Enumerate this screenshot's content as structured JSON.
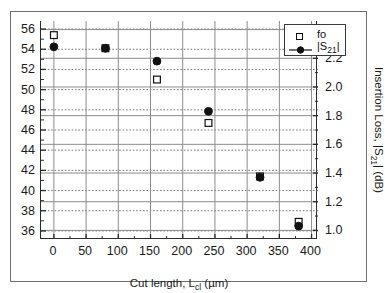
{
  "chart_data": {
    "type": "scatter",
    "title": "",
    "xlabel": "Cut length, L_cl (um)",
    "xlabel_parts": {
      "main": "Cut length, L",
      "sub": "cl",
      "tail": " (µm)"
    },
    "ylabel": "Center frequency, f_o (GHz)",
    "ylabel_parts": {
      "main": "Center frequency, f",
      "sub": "o",
      "tail": " (GHz)"
    },
    "ylabel_right": "Insertion Loss, |S21| (dB)",
    "ylabel_right_parts": {
      "main": "Insertion Loss, |S",
      "sub": "21",
      "tail": "| (dB)"
    },
    "xlim": [
      -20,
      410
    ],
    "xticks": [
      0,
      50,
      100,
      150,
      200,
      250,
      300,
      350,
      400
    ],
    "xtick_labels": [
      "0",
      "50",
      "100",
      "150",
      "200",
      "250",
      "300",
      "350",
      "400"
    ],
    "ylim": [
      35.2,
      56.8
    ],
    "yticks": [
      36,
      38,
      40,
      42,
      44,
      46,
      48,
      50,
      52,
      54,
      56
    ],
    "ytick_labels": [
      "36",
      "38",
      "40",
      "42",
      "44",
      "46",
      "48",
      "50",
      "52",
      "54",
      "56"
    ],
    "ylim_right": [
      0.94,
      2.46
    ],
    "yticks_right": [
      1.0,
      1.2,
      1.4,
      1.6,
      1.8,
      2.0,
      2.2,
      2.4
    ],
    "ytick_labels_right": [
      "1.0",
      "1.2",
      "1.4",
      "1.6",
      "1.8",
      "2.0",
      "2.2",
      "2.4"
    ],
    "grid": true,
    "legend_position": "top-right",
    "x": [
      0,
      80,
      160,
      240,
      320,
      380
    ],
    "series": [
      {
        "name": "fo",
        "axis": "left",
        "marker": "open-square",
        "color": "#111111",
        "values": [
          55.4,
          54.1,
          51.0,
          46.7,
          41.4,
          36.9
        ]
      },
      {
        "name": "|S21|",
        "label_parts": {
          "main": "|S",
          "sub": "21",
          "tail": "|"
        },
        "axis": "right",
        "marker": "filled-circle",
        "color": "#111111",
        "values": [
          2.28,
          2.27,
          2.18,
          1.83,
          1.37,
          1.03
        ]
      }
    ]
  },
  "legend": {
    "items": [
      {
        "label": "fo",
        "marker": "open-square"
      },
      {
        "label": "|S21|",
        "marker": "filled-circle-line"
      }
    ]
  },
  "colors": {
    "axis": "#2b2b2b",
    "grid_dotted": "#777777",
    "grid_solid": "#8c8c8c",
    "marker": "#111111",
    "frame": "#6e6e6e",
    "background": "#ffffff"
  }
}
